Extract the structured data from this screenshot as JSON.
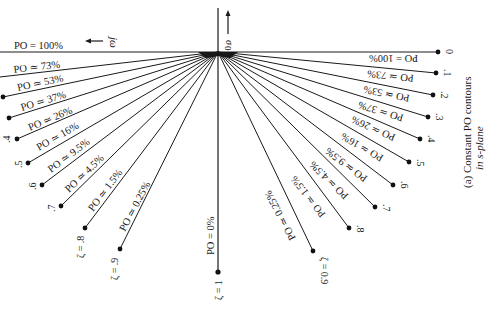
{
  "figure": {
    "caption_line1": "(a) Constant PO contours",
    "caption_line2": "in s-plane",
    "axis_sigma_label": "σ",
    "axis_origin_label": "0",
    "axis_jw_label": "jω",
    "left_arrow": "←",
    "up_arrow": "↑"
  },
  "contours": [
    {
      "zeta": "0",
      "po_left": "PO = 100%",
      "po_right": "PO = 100%"
    },
    {
      "zeta": ".1",
      "po_left": "PO ≃ 73%",
      "po_right": "PO ≃ 73%"
    },
    {
      "zeta": ".2",
      "po_left": "PO ≃ 53%",
      "po_right": "PO ≃ 53%"
    },
    {
      "zeta": ".3",
      "po_left": "PO ≃ 37%",
      "po_right": "PO ≃ 37%"
    },
    {
      "zeta": ".4",
      "po_left": "PO ≃ 26%",
      "po_right": "PO ≃ 26%"
    },
    {
      "zeta": ".5",
      "po_left": "PO ≃ 16%",
      "po_right": "PO ≃ 16%"
    },
    {
      "zeta": ".6",
      "po_left": "PO ≃ 9.5%",
      "po_right": "PO ≃ 9.5%"
    },
    {
      "zeta": ".7",
      "po_left": "PO ≃ 4.5%",
      "po_right": "PO ≃ 4.5%"
    },
    {
      "zeta": ".8",
      "po_left": "PO ≃ 1.5%",
      "po_right": "PO ≃ 1.5%"
    },
    {
      "zeta": ".9",
      "po_left": "PO ≃ 0.25%",
      "po_right": "PO ≃ 0.25%"
    },
    {
      "zeta": "1",
      "po_left": "PO = 0%",
      "po_right": ""
    }
  ],
  "zeta_labels": {
    "left_8": "ζ = .8",
    "left_9": "ζ = .9",
    "right_9": "ζ = 0.9",
    "one": "ζ = 1"
  }
}
